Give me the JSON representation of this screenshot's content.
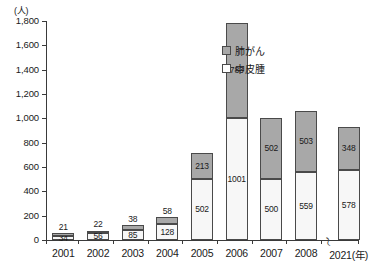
{
  "chart_data": {
    "type": "bar",
    "stacked": true,
    "title": "",
    "subtitle": "",
    "xlabel": "(年)",
    "ylabel": "(人)",
    "unit_label": "(人)",
    "ylim": [
      0,
      1800
    ],
    "ytick_step": 200,
    "grid": false,
    "legend_position": "top-right",
    "axis_break": {
      "symbol": "〜",
      "between": [
        "2008",
        "2021"
      ],
      "note": "x-axis break between 2008 and 2021"
    },
    "categories": [
      "2001",
      "2002",
      "2003",
      "2004",
      "2005",
      "2006",
      "2007",
      "2008",
      "2021"
    ],
    "ytick_labels": [
      "0",
      "200",
      "400",
      "600",
      "800",
      "1,000",
      "1,200",
      "1,400",
      "1,600",
      "1,800"
    ],
    "ytick_values": [
      0,
      200,
      400,
      600,
      800,
      1000,
      1200,
      1400,
      1600,
      1800
    ],
    "series": [
      {
        "name": "中皮腫",
        "color": "#f7f7f7",
        "stack_order": 0,
        "values": [
          34,
          56,
          85,
          128,
          502,
          1001,
          500,
          559,
          578
        ]
      },
      {
        "name": "肺がん",
        "color": "#a8a8a8",
        "stack_order": 1,
        "values": [
          21,
          22,
          38,
          58,
          213,
          783,
          502,
          503,
          348
        ]
      }
    ],
    "totals": [
      55,
      78,
      123,
      186,
      715,
      1784,
      1002,
      1062,
      926
    ]
  },
  "legend": {
    "items": [
      {
        "label": "肺がん",
        "swatch": "gray"
      },
      {
        "label": "中皮腫",
        "swatch": "white"
      }
    ]
  },
  "axis": {
    "x_unit_suffix": "(年)",
    "break_symbol": "〜"
  }
}
